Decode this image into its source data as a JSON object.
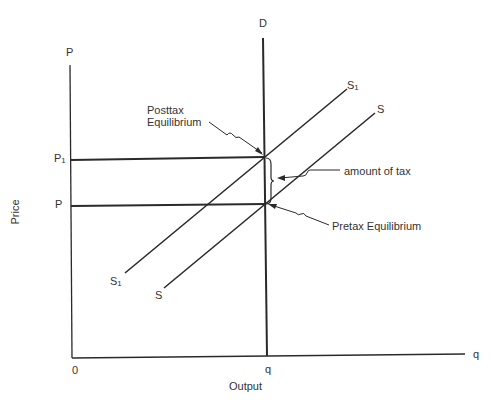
{
  "figure": {
    "type": "supply-demand tax incidence diagram",
    "axes": {
      "y_axis_top_label": "P",
      "y_axis_title": "Price",
      "x_axis_end_label": "q",
      "x_axis_title": "Output",
      "origin_label": "0"
    },
    "price_levels": [
      {
        "label_main": "P",
        "label_sub": "1",
        "meaning": "posttax price"
      },
      {
        "label_main": "P",
        "label_sub": "",
        "meaning": "pretax price"
      }
    ],
    "quantity_tick": "q",
    "curves": {
      "demand": {
        "label": "D",
        "shape": "vertical (perfectly inelastic)"
      },
      "supply_post": {
        "label_main": "S",
        "label_sub": "1"
      },
      "supply_pre": {
        "label_main": "S",
        "label_sub": ""
      }
    },
    "annotations": {
      "posttax_line1": "Posttax",
      "posttax_line2": "Equilibrium",
      "amount_of_tax": "amount of tax",
      "pretax": "Pretax Equilibrium"
    },
    "colors": {
      "line": "#2a2a2a",
      "background": "#ffffff"
    }
  }
}
